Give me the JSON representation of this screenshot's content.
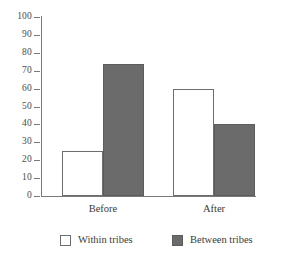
{
  "chart_data": {
    "type": "bar",
    "title": "",
    "subtitle": "",
    "xlabel": "",
    "ylabel": "",
    "categories": [
      "Before",
      "After"
    ],
    "series": [
      {
        "name": "Within tribes",
        "values": [
          25,
          60
        ],
        "color": "#ffffff"
      },
      {
        "name": "Between tribes",
        "values": [
          74,
          40
        ],
        "color": "#6b6b6b"
      }
    ],
    "ylim": [
      0,
      100
    ],
    "ytick_step": 10,
    "ytick_labels": [
      "100",
      "90",
      "80",
      "70",
      "60",
      "50",
      "40",
      "30",
      "20",
      "10",
      "0"
    ],
    "ytick_values": [
      100,
      90,
      80,
      70,
      60,
      50,
      40,
      30,
      20,
      10,
      0
    ],
    "grid": false,
    "legend_position": "bottom",
    "axis_color": "#7a7a7a",
    "background": "#ffffff"
  },
  "legend": {
    "items": [
      {
        "label": "Within tribes",
        "swatch": "white"
      },
      {
        "label": "Between tribes",
        "swatch": "gray"
      }
    ]
  }
}
